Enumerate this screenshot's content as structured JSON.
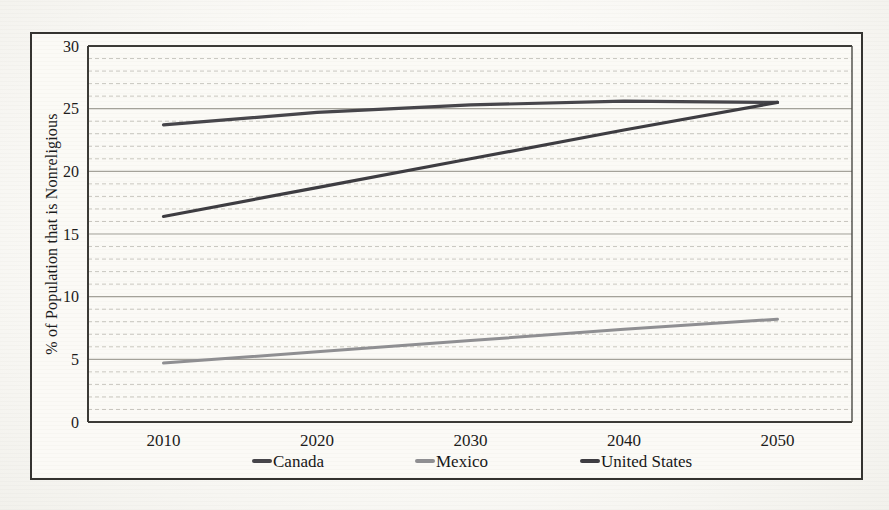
{
  "chart_data": {
    "type": "line",
    "title": "",
    "xlabel": "",
    "ylabel": "% of Population that is Nonreligious",
    "categories": [
      "2010",
      "2020",
      "2030",
      "2040",
      "2050"
    ],
    "series": [
      {
        "name": "Canada",
        "color": "#46454a",
        "line_width": 3.2,
        "values": [
          23.7,
          24.7,
          25.3,
          25.6,
          25.5
        ]
      },
      {
        "name": "Mexico",
        "color": "#8f8f92",
        "line_width": 3.0,
        "values": [
          4.7,
          5.6,
          6.5,
          7.4,
          8.2
        ]
      },
      {
        "name": "United States",
        "color": "#3d3c41",
        "line_width": 3.2,
        "values": [
          16.4,
          18.7,
          21.0,
          23.3,
          25.5
        ]
      }
    ],
    "ylim": [
      0,
      30
    ],
    "y_major_step": 5,
    "y_minor_step": 1,
    "y_ticks": [
      "0",
      "5",
      "10",
      "15",
      "20",
      "25",
      "30"
    ],
    "grid": "horizontal, dotted minor every 1, solid major every 5",
    "legend_position": "bottom"
  }
}
